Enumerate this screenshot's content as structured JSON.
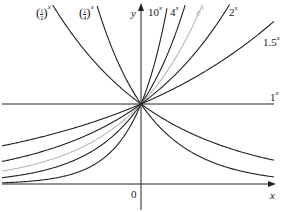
{
  "chart_data": {
    "type": "line",
    "title": "",
    "xlabel": "x",
    "ylabel": "y",
    "origin_label": "0",
    "xlim": [
      -1.83,
      1.75
    ],
    "ylim": [
      -0.35,
      2.3
    ],
    "grid": false,
    "legend": "inline labels",
    "series": [
      {
        "name": "(1/2)^x",
        "base": 0.5,
        "color": "#222222",
        "label_html": "half"
      },
      {
        "name": "(1/4)^x",
        "base": 0.25,
        "color": "#222222",
        "label_html": "quarter"
      },
      {
        "name": "10^x",
        "base": 10,
        "color": "#222222"
      },
      {
        "name": "4^x",
        "base": 4,
        "color": "#222222"
      },
      {
        "name": "e^x",
        "base": 2.71828,
        "color": "#b8b8b8"
      },
      {
        "name": "2^x",
        "base": 2,
        "color": "#222222"
      },
      {
        "name": "1.5^x",
        "base": 1.5,
        "color": "#222222"
      },
      {
        "name": "1^x",
        "base": 1,
        "color": "#222222"
      }
    ],
    "annotations": [
      "curves all pass through (0, 1)"
    ]
  },
  "labels": {
    "half_num": "1",
    "half_den": "2",
    "quarter_num": "1",
    "quarter_den": "4",
    "ten_base": "10",
    "four_base": "4",
    "e_base": "e",
    "two_base": "2",
    "onefive_base": "1.5",
    "one_base": "1",
    "exp": "x",
    "y_axis": "y",
    "x_axis": "x",
    "origin": "0",
    "lparen": "(",
    "rparen": ")"
  }
}
